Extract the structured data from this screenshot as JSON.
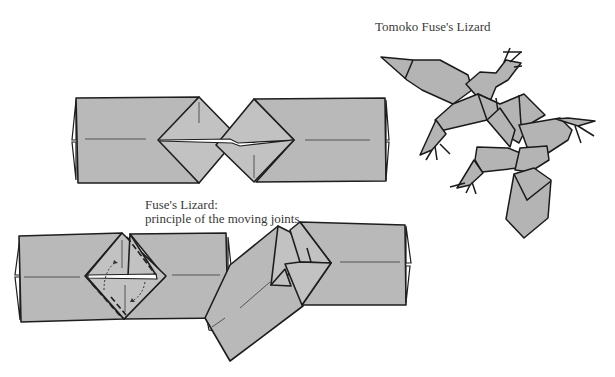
{
  "page": {
    "top_text_fragment": "...ppy  ...p ... ... ...p ... ...pp..."
  },
  "captions": {
    "lizard_title": "Tomoko Fuse's Lizard",
    "principle_title": "Fuse's Lizard:",
    "principle_subtitle": "principle of the moving joints"
  },
  "figures": [
    {
      "id": "joint-flat",
      "description": "Two rectangular units joined by interlocking square flaps, flat"
    },
    {
      "id": "joint-open",
      "description": "Two units joined with square joint, dashed fold lines and arrows"
    },
    {
      "id": "joint-rotated",
      "description": "Two units joined at an angle showing moving joint"
    },
    {
      "id": "lizard-model",
      "description": "Finished origami lizard with four legs, head and tail"
    }
  ],
  "colors": {
    "paper_fill": "#b9b9b9",
    "outline": "#1e1e1e",
    "text": "#3a3a3a",
    "background": "#ffffff"
  }
}
